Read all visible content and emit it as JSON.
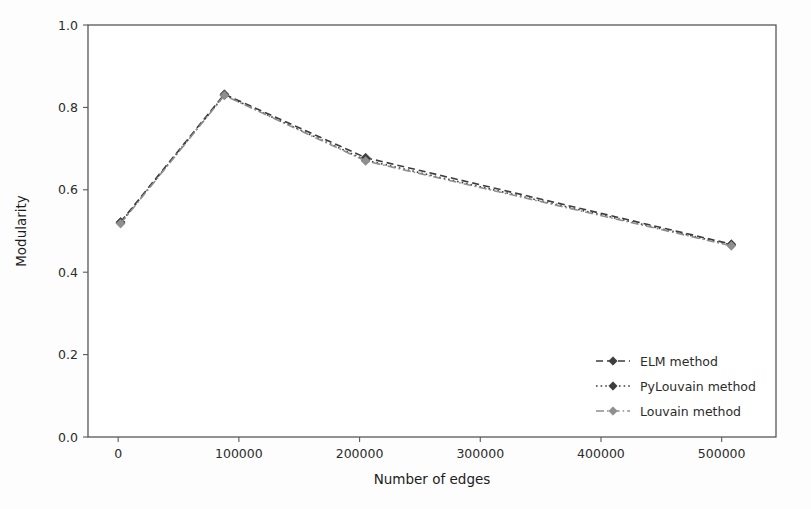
{
  "figure": {
    "background_color": "#fdfdfd",
    "plot_background_color": "#ffffff",
    "axis_color": "#4a4a4a"
  },
  "chart_data": {
    "type": "line",
    "title": "",
    "xlabel": "Number of edges",
    "ylabel": "Modularity",
    "xlim": [
      -25000,
      545000
    ],
    "ylim": [
      0.0,
      1.0
    ],
    "xticks": [
      0,
      100000,
      200000,
      300000,
      400000,
      500000
    ],
    "xtick_labels": [
      "0",
      "100000",
      "200000",
      "300000",
      "400000",
      "500000"
    ],
    "yticks": [
      0.0,
      0.2,
      0.4,
      0.6,
      0.8,
      1.0
    ],
    "ytick_labels": [
      "0.0",
      "0.2",
      "0.4",
      "0.6",
      "0.8",
      "1.0"
    ],
    "grid": false,
    "legend_position": "lower right",
    "series": [
      {
        "name": "ELM method",
        "color": "#3d3d3d",
        "linestyle": "dashed",
        "marker": "diamond",
        "x": [
          2000,
          88000,
          205000,
          508000
        ],
        "values": [
          0.522,
          0.832,
          0.678,
          0.468
        ]
      },
      {
        "name": "PyLouvain method",
        "color": "#3d3d3d",
        "linestyle": "dotted",
        "marker": "diamond",
        "x": [
          2000,
          88000,
          205000,
          508000
        ],
        "values": [
          0.52,
          0.83,
          0.672,
          0.466
        ]
      },
      {
        "name": "Louvain method",
        "color": "#8f8f8f",
        "linestyle": "dashdot",
        "marker": "diamond",
        "x": [
          2000,
          88000,
          205000,
          508000
        ],
        "values": [
          0.518,
          0.829,
          0.67,
          0.464
        ]
      }
    ]
  },
  "legend": {
    "entries": [
      {
        "label": "ELM method"
      },
      {
        "label": "PyLouvain method"
      },
      {
        "label": "Louvain method"
      }
    ]
  }
}
